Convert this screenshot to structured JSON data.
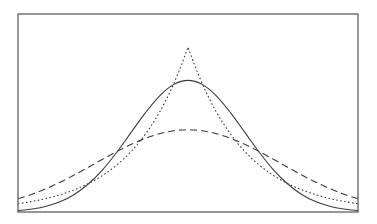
{
  "chart_data": {
    "type": "line",
    "title": "",
    "xlabel": "",
    "ylabel": "",
    "xlim": [
      -3,
      3
    ],
    "ylim": [
      0,
      0.6
    ],
    "grid": false,
    "legend": null,
    "frame": true,
    "x": [
      -3,
      -2.75,
      -2.5,
      -2.25,
      -2,
      -1.75,
      -1.5,
      -1.25,
      -1,
      -0.75,
      -0.5,
      -0.25,
      0,
      0.25,
      0.5,
      0.75,
      1,
      1.25,
      1.5,
      1.75,
      2,
      2.25,
      2.5,
      2.75,
      3
    ],
    "series": [
      {
        "name": "solid",
        "style": "solid",
        "description": "normal density, sd 1",
        "values": [
          0.0044,
          0.0091,
          0.0175,
          0.0317,
          0.054,
          0.0863,
          0.1295,
          0.1826,
          0.242,
          0.3011,
          0.3521,
          0.3867,
          0.3989,
          0.3867,
          0.3521,
          0.3011,
          0.242,
          0.1826,
          0.1295,
          0.0863,
          0.054,
          0.0317,
          0.0175,
          0.0091,
          0.0044
        ]
      },
      {
        "name": "dashed",
        "style": "dashed",
        "description": "wider normal density, sd about 1.6",
        "values": [
          0.04,
          0.054,
          0.071,
          0.0908,
          0.1129,
          0.1364,
          0.1603,
          0.1837,
          0.2051,
          0.2234,
          0.2374,
          0.2463,
          0.2493,
          0.2463,
          0.2374,
          0.2234,
          0.2051,
          0.1837,
          0.1603,
          0.1364,
          0.1129,
          0.0908,
          0.071,
          0.054,
          0.04
        ]
      },
      {
        "name": "dotted",
        "style": "dotted",
        "description": "Laplace density, scale 1",
        "values": [
          0.0249,
          0.032,
          0.041,
          0.0527,
          0.0677,
          0.0869,
          0.1116,
          0.1433,
          0.1839,
          0.2362,
          0.3033,
          0.3894,
          0.5,
          0.3894,
          0.3033,
          0.2362,
          0.1839,
          0.1433,
          0.1116,
          0.0869,
          0.0677,
          0.0527,
          0.041,
          0.032,
          0.0249
        ]
      }
    ]
  }
}
